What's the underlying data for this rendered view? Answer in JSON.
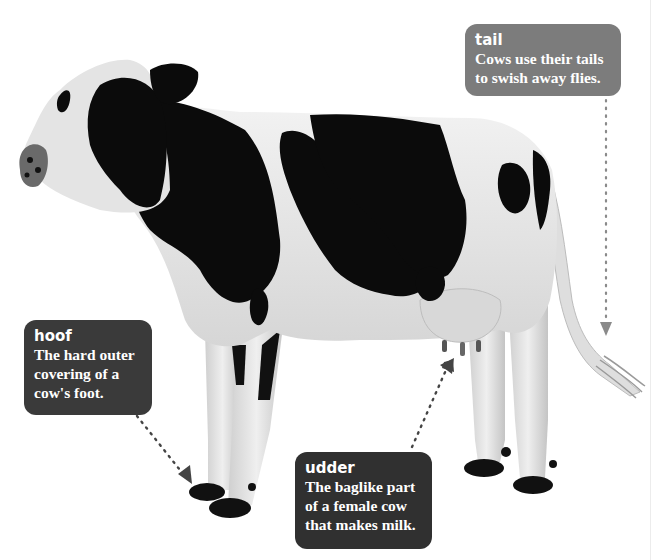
{
  "figure": {
    "background_color": "#ffffff",
    "labels": [
      {
        "id": "tail",
        "term": "tail",
        "description_lines": [
          "Cows use their tails",
          "to swish away flies."
        ],
        "box_color": "#7c7c7c",
        "pointer": "dotted-arrow-down"
      },
      {
        "id": "hoof",
        "term": "hoof",
        "description_lines": [
          "The hard outer",
          "covering of a",
          "cow's foot."
        ],
        "box_color": "#3a3a3a",
        "pointer": "dotted-arrow-down-right"
      },
      {
        "id": "udder",
        "term": "udder",
        "description_lines": [
          "The baglike part",
          "of a female cow",
          "that makes milk."
        ],
        "box_color": "#303030",
        "pointer": "dotted-arrow-up-right"
      }
    ],
    "colors": {
      "cow_black": "#0b0b0b",
      "cow_white": "#e6e6e6",
      "cow_shade": "#c9c9c9",
      "pointer_dark": "#444444",
      "pointer_light": "#8a8a8a"
    }
  }
}
